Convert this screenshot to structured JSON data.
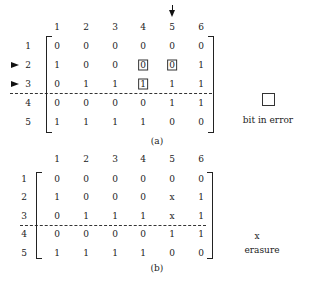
{
  "figure_a": {
    "caption": "(a)",
    "column_headers": [
      "1",
      "2",
      "3",
      "4",
      "5",
      "6"
    ],
    "row_labels": [
      "1",
      "2",
      "3",
      "4",
      "5"
    ],
    "rows": [
      [
        "0",
        "0",
        "0",
        "0",
        "0",
        "0"
      ],
      [
        "1",
        "0",
        "0",
        "0",
        "0",
        "1"
      ],
      [
        "0",
        "1",
        "1",
        "1",
        "1",
        "1"
      ],
      [
        "0",
        "0",
        "0",
        "0",
        "1",
        "1"
      ],
      [
        "1",
        "1",
        "1",
        "1",
        "0",
        "0"
      ]
    ],
    "bits_in_error": [
      [
        1,
        3
      ],
      [
        1,
        4
      ],
      [
        2,
        3
      ]
    ],
    "marked_rows": [
      "2",
      "3"
    ],
    "marked_column": "5",
    "legend_label": "bit in error"
  },
  "figure_b": {
    "caption": "(b)",
    "column_headers": [
      "1",
      "2",
      "3",
      "4",
      "5",
      "6"
    ],
    "row_labels": [
      "1",
      "2",
      "3",
      "4",
      "5"
    ],
    "rows": [
      [
        "0",
        "0",
        "0",
        "0",
        "0",
        "0"
      ],
      [
        "1",
        "0",
        "0",
        "0",
        "x",
        "1"
      ],
      [
        "0",
        "1",
        "1",
        "1",
        "x",
        "1"
      ],
      [
        "0",
        "0",
        "0",
        "0",
        "1",
        "1"
      ],
      [
        "1",
        "1",
        "1",
        "1",
        "0",
        "0"
      ]
    ],
    "legend_symbol": "x",
    "legend_label": "erasure"
  }
}
